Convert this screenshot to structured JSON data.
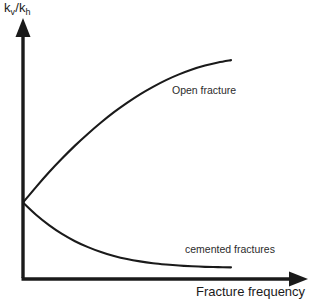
{
  "figure": {
    "background_color": "#ffffff",
    "ink_color": "#1a1a1a"
  },
  "axes": {
    "y_label_full": "kv/kh",
    "y_label_num_base": "k",
    "y_label_num_sub": "v",
    "y_label_slash": "/",
    "y_label_den_base": "k",
    "y_label_den_sub": "h",
    "x_label": "Fracture frequency"
  },
  "annotations": {
    "open_fracture": "Open fracture",
    "cemented_fractures": "cemented fractures"
  },
  "chart_data": {
    "type": "line",
    "title": "",
    "subtitle": "",
    "xlabel": "Fracture frequency",
    "ylabel": "kv/kh",
    "xlim": [
      0,
      1
    ],
    "ylim": [
      0,
      1
    ],
    "grid": false,
    "legend_position": "inline-curve-labels",
    "axis_style": "arrow-headed",
    "tick_labels": {
      "x": [],
      "y": []
    },
    "series": [
      {
        "name": "Open fracture",
        "color": "#1a1a1a",
        "label_position": {
          "x": 0.72,
          "y": 0.8
        },
        "x": [
          0.0,
          0.05,
          0.1,
          0.15,
          0.2,
          0.25,
          0.3,
          0.35,
          0.4,
          0.45,
          0.5,
          0.55,
          0.6,
          0.65,
          0.7,
          0.75,
          0.8
        ],
        "y": [
          0.295,
          0.355,
          0.412,
          0.465,
          0.515,
          0.561,
          0.604,
          0.644,
          0.68,
          0.713,
          0.742,
          0.768,
          0.79,
          0.809,
          0.824,
          0.836,
          0.845
        ]
      },
      {
        "name": "cemented fractures",
        "color": "#1a1a1a",
        "label_position": {
          "x": 0.76,
          "y": 0.26
        },
        "x": [
          0.0,
          0.05,
          0.1,
          0.15,
          0.2,
          0.25,
          0.3,
          0.35,
          0.4,
          0.45,
          0.5,
          0.55,
          0.6,
          0.65,
          0.7,
          0.75,
          0.8
        ],
        "y": [
          0.295,
          0.248,
          0.208,
          0.174,
          0.146,
          0.123,
          0.104,
          0.089,
          0.077,
          0.068,
          0.061,
          0.056,
          0.052,
          0.049,
          0.047,
          0.046,
          0.045
        ]
      }
    ]
  }
}
